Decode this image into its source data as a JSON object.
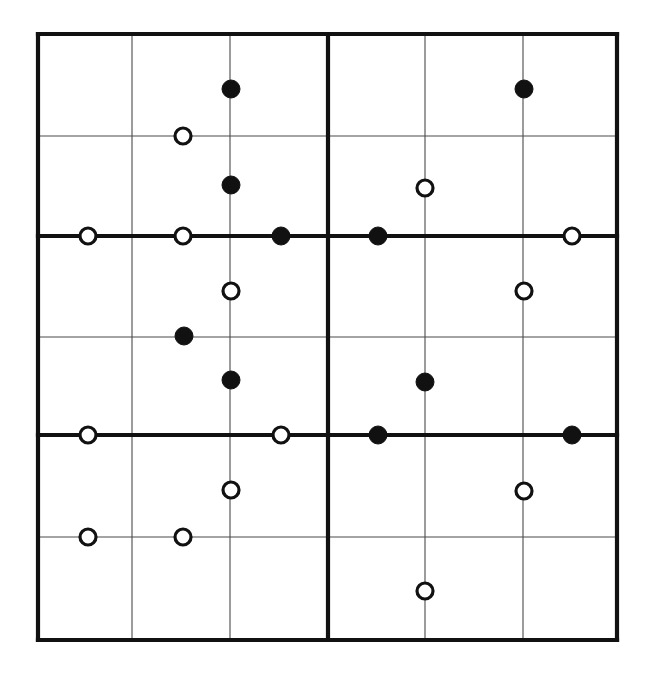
{
  "figure": {
    "title": "",
    "caption": "",
    "background_color": "#ffffff",
    "ink_color": "#111111",
    "grid_color": "#4a4a4a"
  },
  "chart_data": {
    "type": "scatter",
    "title": "",
    "subtitle": "",
    "xlabel": "",
    "ylabel": "",
    "grid": true,
    "legend_position": "none",
    "panel_layout": "2 columns x 1 row",
    "xlim": [
      0,
      6
    ],
    "ylim": [
      0,
      6
    ],
    "x_tick_labels": [],
    "y_tick_labels": [],
    "axis_frame": {
      "left": 38,
      "top": 34,
      "right": 617,
      "bottom": 640
    },
    "vertical_gridlines": [
      {
        "x": 38,
        "weight": "major"
      },
      {
        "x": 132,
        "weight": "minor"
      },
      {
        "x": 230,
        "weight": "minor"
      },
      {
        "x": 328,
        "weight": "major"
      },
      {
        "x": 425,
        "weight": "minor"
      },
      {
        "x": 523,
        "weight": "minor"
      },
      {
        "x": 617,
        "weight": "major"
      }
    ],
    "horizontal_gridlines": [
      {
        "y": 34,
        "weight": "major"
      },
      {
        "y": 136,
        "weight": "minor"
      },
      {
        "y": 236,
        "weight": "major"
      },
      {
        "y": 337,
        "weight": "minor"
      },
      {
        "y": 435,
        "weight": "major"
      },
      {
        "y": 537,
        "weight": "minor"
      },
      {
        "y": 640,
        "weight": "major"
      }
    ],
    "series": [
      {
        "name": "filled",
        "marker": "filled-circle",
        "marker_color": "#111111",
        "radius": 9,
        "points": [
          {
            "px": 231,
            "py": 89,
            "panel": "left"
          },
          {
            "px": 231,
            "py": 185,
            "panel": "left"
          },
          {
            "px": 281,
            "py": 236,
            "panel": "left"
          },
          {
            "px": 184,
            "py": 336,
            "panel": "left"
          },
          {
            "px": 231,
            "py": 380,
            "panel": "left"
          },
          {
            "px": 524,
            "py": 89,
            "panel": "right"
          },
          {
            "px": 378,
            "py": 236,
            "panel": "right"
          },
          {
            "px": 425,
            "py": 382,
            "panel": "right"
          },
          {
            "px": 378,
            "py": 435,
            "panel": "right"
          },
          {
            "px": 572,
            "py": 435,
            "panel": "right"
          }
        ]
      },
      {
        "name": "open",
        "marker": "open-circle",
        "marker_color": "#ffffff",
        "radius": 8,
        "points": [
          {
            "px": 183,
            "py": 136,
            "panel": "left"
          },
          {
            "px": 88,
            "py": 236,
            "panel": "left"
          },
          {
            "px": 183,
            "py": 236,
            "panel": "left"
          },
          {
            "px": 231,
            "py": 291,
            "panel": "left"
          },
          {
            "px": 88,
            "py": 435,
            "panel": "left"
          },
          {
            "px": 281,
            "py": 435,
            "panel": "left"
          },
          {
            "px": 231,
            "py": 490,
            "panel": "left"
          },
          {
            "px": 88,
            "py": 537,
            "panel": "left"
          },
          {
            "px": 183,
            "py": 537,
            "panel": "left"
          },
          {
            "px": 425,
            "py": 188,
            "panel": "right"
          },
          {
            "px": 572,
            "py": 236,
            "panel": "right"
          },
          {
            "px": 524,
            "py": 291,
            "panel": "right"
          },
          {
            "px": 524,
            "py": 491,
            "panel": "right"
          },
          {
            "px": 425,
            "py": 591,
            "panel": "right"
          }
        ]
      }
    ]
  }
}
